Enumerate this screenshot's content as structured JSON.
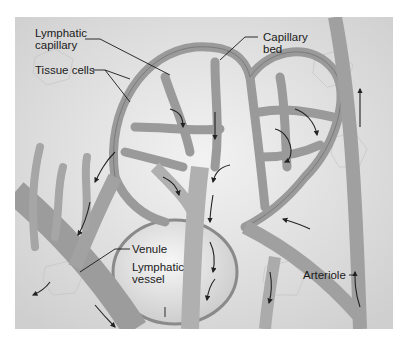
{
  "figure": {
    "palette": {
      "background": "#ffffff",
      "tissue": "#d9d9d9",
      "tissue_light": "#ececec",
      "vessel": "#a8a8a8",
      "vessel_edge": "#6e6e6e",
      "arrow": "#222222"
    },
    "labels": {
      "lymphatic_capillary": "Lymphatic\ncapillary",
      "tissue_cells": "Tissue cells",
      "capillary_bed": "Capillary\nbed",
      "venule": "Venule",
      "lymphatic_vessel": "Lymphatic\nvessel",
      "arteriole": "Arteriole"
    }
  }
}
